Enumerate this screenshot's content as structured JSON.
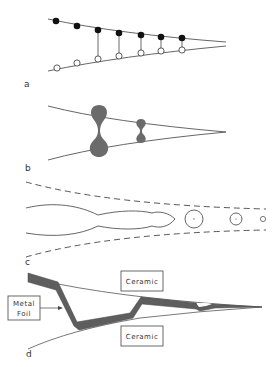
{
  "figure": {
    "panels": [
      {
        "id": "a",
        "label": "a",
        "description": "Two converging grain boundary lines with paired black (upper) and white (lower) atoms connected by bonds"
      },
      {
        "id": "b",
        "label": "b",
        "description": "Converging lines with pinched liquid-like bridges (large and small) between surfaces"
      },
      {
        "id": "c",
        "label": "c",
        "description": "Dashed crack boundaries enclosing an elongated cavity and a trail of shrinking pores"
      },
      {
        "id": "d",
        "label": "d",
        "description": "Metal foil penetrating a ceramic-ceramic wedge interface"
      }
    ],
    "annotations": {
      "ceramic_top": "Ceramic",
      "ceramic_bottom": "Ceramic",
      "metal_foil_line1": "Metal",
      "metal_foil_line2": "Foil"
    },
    "colors": {
      "line": "#555555",
      "filled_atom": "#111111",
      "open_atom": "#ffffff",
      "liquid": "#6b6b6b",
      "foil": "#5e5e5e"
    }
  }
}
